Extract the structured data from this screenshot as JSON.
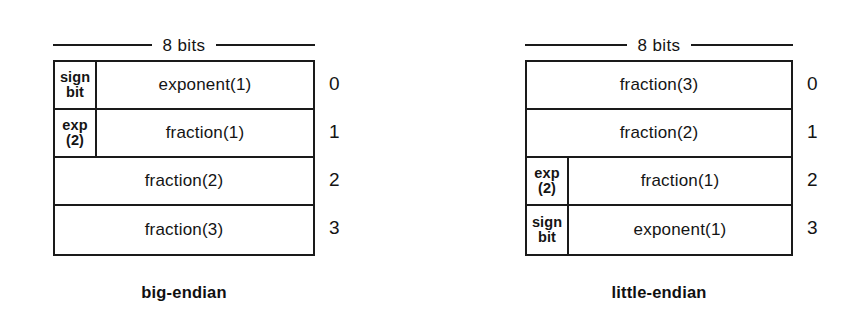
{
  "figure": {
    "background_color": "#ffffff",
    "line_color": "#1a1a1a",
    "text_color": "#141414"
  },
  "panels": [
    {
      "id": "big-endian",
      "width_caption": "8 bits",
      "label": "big-endian",
      "byte_indices": [
        "0",
        "1",
        "2",
        "3"
      ],
      "rows": [
        {
          "index": "0",
          "narrow_field": {
            "line1": "sign",
            "line2": "bit"
          },
          "wide_field": "exponent(1)"
        },
        {
          "index": "1",
          "narrow_field": {
            "line1": "exp",
            "line2": "(2)"
          },
          "wide_field": "fraction(1)"
        },
        {
          "index": "2",
          "narrow_field": null,
          "wide_field": "fraction(2)"
        },
        {
          "index": "3",
          "narrow_field": null,
          "wide_field": "fraction(3)"
        }
      ]
    },
    {
      "id": "little-endian",
      "width_caption": "8 bits",
      "label": "little-endian",
      "byte_indices": [
        "0",
        "1",
        "2",
        "3"
      ],
      "rows": [
        {
          "index": "0",
          "narrow_field": null,
          "wide_field": "fraction(3)"
        },
        {
          "index": "1",
          "narrow_field": null,
          "wide_field": "fraction(2)"
        },
        {
          "index": "2",
          "narrow_field": {
            "line1": "exp",
            "line2": "(2)"
          },
          "wide_field": "fraction(1)"
        },
        {
          "index": "3",
          "narrow_field": {
            "line1": "sign",
            "line2": "bit"
          },
          "wide_field": "exponent(1)"
        }
      ]
    }
  ]
}
